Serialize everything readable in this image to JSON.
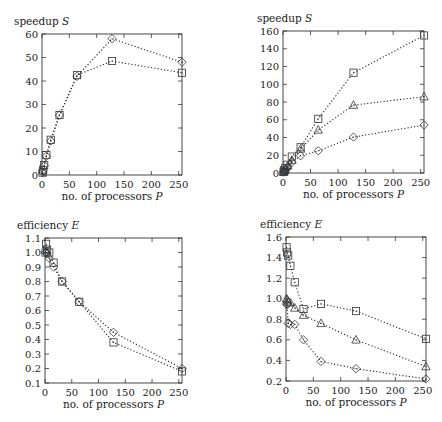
{
  "chart_data": [
    {
      "id": "top-left",
      "type": "line",
      "title": "",
      "ylabel": "speedup S",
      "xlabel": "no. of processors P",
      "xlim": [
        0,
        256
      ],
      "ylim": [
        0,
        60
      ],
      "xticks": [
        0,
        50,
        100,
        150,
        200,
        250
      ],
      "yticks": [
        0,
        10,
        20,
        30,
        40,
        50,
        60
      ],
      "grid": false,
      "legend": null,
      "frame": {
        "x": 42,
        "y": 34,
        "w": 140,
        "h": 141
      },
      "series": [
        {
          "name": "series-diamond",
          "marker": "diamond",
          "x": [
            1,
            2,
            4,
            8,
            16,
            32,
            64,
            128,
            256
          ],
          "y": [
            1,
            2,
            4,
            8,
            14.5,
            25.5,
            42,
            58,
            48
          ]
        },
        {
          "name": "series-square",
          "marker": "square",
          "x": [
            1,
            2,
            4,
            8,
            16,
            32,
            64,
            128,
            256
          ],
          "y": [
            1,
            2,
            4.2,
            8.5,
            15,
            25.5,
            42.5,
            48.5,
            43.5
          ]
        }
      ]
    },
    {
      "id": "top-right",
      "type": "line",
      "title": "",
      "ylabel": "speedup S",
      "xlabel": "no. of processors P",
      "xlim": [
        0,
        256
      ],
      "ylim": [
        0,
        160
      ],
      "xticks": [
        0,
        50,
        100,
        150,
        200,
        250
      ],
      "yticks": [
        0,
        20,
        40,
        60,
        80,
        100,
        120,
        140,
        160
      ],
      "grid": false,
      "legend": null,
      "frame": {
        "x": 283,
        "y": 31,
        "w": 141,
        "h": 142
      },
      "series": [
        {
          "name": "series-square",
          "marker": "square",
          "x": [
            1,
            2,
            4,
            8,
            16,
            32,
            64,
            128,
            256
          ],
          "y": [
            1.5,
            2.9,
            5.3,
            9.3,
            18.5,
            29,
            61,
            113,
            155
          ]
        },
        {
          "name": "series-triangle",
          "marker": "triangle",
          "x": [
            1,
            2,
            4,
            8,
            16,
            32,
            64,
            128,
            256
          ],
          "y": [
            1,
            2,
            3.9,
            7.7,
            14.5,
            27,
            48.5,
            76.5,
            86
          ]
        },
        {
          "name": "series-diamond",
          "marker": "diamond",
          "x": [
            1,
            2,
            4,
            8,
            16,
            32,
            64,
            128,
            256
          ],
          "y": [
            1,
            1.9,
            3,
            6,
            12,
            19.5,
            25,
            40.5,
            54
          ]
        }
      ]
    },
    {
      "id": "bottom-left",
      "type": "line",
      "title": "",
      "ylabel": "efficiency E",
      "xlabel": "no. of processors P",
      "xlim": [
        0,
        256
      ],
      "ylim": [
        0.1,
        1.1
      ],
      "xticks": [
        0,
        50,
        100,
        150,
        200,
        250
      ],
      "yticks": [
        0.1,
        0.2,
        0.3,
        0.4,
        0.5,
        0.6,
        0.7,
        0.8,
        0.9,
        1.0,
        1.1
      ],
      "grid": false,
      "legend": null,
      "frame": {
        "x": 45,
        "y": 238,
        "w": 137,
        "h": 145
      },
      "series": [
        {
          "name": "series-diamond",
          "marker": "diamond",
          "x": [
            1,
            2,
            4,
            8,
            16,
            32,
            64,
            128,
            256
          ],
          "y": [
            1.0,
            1.0,
            0.99,
            0.96,
            0.9,
            0.8,
            0.66,
            0.45,
            0.2
          ]
        },
        {
          "name": "series-square",
          "marker": "square",
          "x": [
            1,
            2,
            4,
            8,
            16,
            32,
            64,
            128,
            256
          ],
          "y": [
            1.0,
            1.06,
            1.02,
            1.0,
            0.93,
            0.8,
            0.66,
            0.38,
            0.18
          ]
        }
      ]
    },
    {
      "id": "bottom-right",
      "type": "line",
      "title": "",
      "ylabel": "efficiency E",
      "xlabel": "no. of processors P",
      "xlim": [
        0,
        256
      ],
      "ylim": [
        0.2,
        1.6
      ],
      "xticks": [
        0,
        50,
        100,
        150,
        200,
        250
      ],
      "yticks": [
        0.2,
        0.4,
        0.6,
        0.8,
        1.0,
        1.2,
        1.4,
        1.6
      ],
      "grid": false,
      "legend": null,
      "frame": {
        "x": 286,
        "y": 237,
        "w": 140,
        "h": 144
      },
      "series": [
        {
          "name": "series-square",
          "marker": "square",
          "x": [
            1,
            2,
            4,
            8,
            16,
            32,
            64,
            128,
            256
          ],
          "y": [
            1.5,
            1.45,
            1.42,
            1.32,
            1.16,
            0.9,
            0.95,
            0.88,
            0.61
          ]
        },
        {
          "name": "series-triangle",
          "marker": "triangle",
          "x": [
            1,
            2,
            4,
            8,
            16,
            32,
            64,
            128,
            256
          ],
          "y": [
            1.0,
            0.99,
            0.97,
            0.96,
            0.91,
            0.84,
            0.76,
            0.6,
            0.34
          ]
        },
        {
          "name": "series-diamond",
          "marker": "diamond",
          "x": [
            1,
            2,
            4,
            8,
            16,
            32,
            64,
            128,
            256
          ],
          "y": [
            0.95,
            0.94,
            0.76,
            0.75,
            0.75,
            0.6,
            0.39,
            0.32,
            0.22
          ]
        }
      ]
    }
  ],
  "labels": {
    "tl_ylabel": "speedup S",
    "tr_ylabel": "speedup S",
    "bl_ylabel": "efficiency E",
    "br_ylabel": "efficiency E",
    "xlabel": "no. of processors P"
  }
}
